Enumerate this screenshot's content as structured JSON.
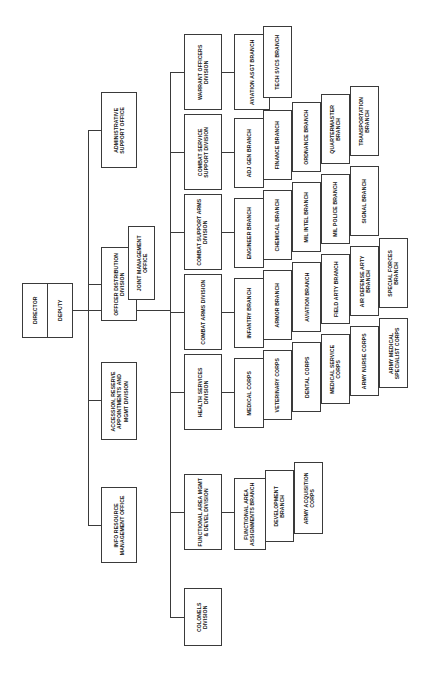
{
  "chart": {
    "orientation": "left-to-right hierarchy with vertically rotated text",
    "type": "org-chart"
  },
  "root": {
    "director": "DIRECTOR",
    "deputy": "DEPUTY"
  },
  "staff_offices": {
    "administrative_support_office": "ADMINISTRATIVE SUPPORT OFFICE",
    "officer_distribution_division": "OFFICER DISTRIBUTION DIVISION",
    "joint_management_office": "JOINT MANAGEMENT OFFICE",
    "accession_reserve": "ACCESSION, RESERVE APPOINTMENTS AND MGMT DIVISION",
    "info_resource_management_office": "INFO RESOURCE MANAGEMENT OFFICE"
  },
  "divisions": [
    {
      "id": "warrant-officers-division",
      "name": "WARRANT OFFICERS DIVISION",
      "branches": [
        "AVIATION ASGT BRANCH",
        "TECH SVCS BRANCH"
      ]
    },
    {
      "id": "combat-service-support-division",
      "name": "COMBAT SERVICE SUPPORT DIVISION",
      "branches": [
        "ADJ GEN BRANCH",
        "FINANCE BRANCH",
        "ORDNANCE BRANCH",
        "QUARTERMASTER BRANCH",
        "TRANSPORTATION BRANCH"
      ]
    },
    {
      "id": "combat-support-arms-division",
      "name": "COMBAT SUPPORT ARMS DIVISION",
      "branches": [
        "ENGINEER BRANCH",
        "CHEMICAL BRANCH",
        "MIL INTEL BRANCH",
        "MIL POLICE BRANCH",
        "SIGNAL BRANCH"
      ]
    },
    {
      "id": "combat-arms-division",
      "name": "COMBAT ARMS DIVISION",
      "branches": [
        "INFANTRY BRANCH",
        "ARMOR BRANCH",
        "AVIATION BRANCH",
        "FIELD ARTY BRANCH",
        "AIR DEFENSE ARTY BRANCH",
        "SPECIAL FORCES BRANCH"
      ]
    },
    {
      "id": "health-services-division",
      "name": "HEALTH SERVICES DIVISION",
      "branches": [
        "MEDICAL CORPS",
        "VETERINARY CORPS",
        "DENTAL CORPS",
        "MEDICAL SERVICE CORPS",
        "ARMY NURSE CORPS",
        "ARMY MEDICAL SPECIALIST CORPS"
      ]
    },
    {
      "id": "functional-area-mgmt-devel-division",
      "name": "FUNCTIONAL AREA MGMT & DEVEL DIVISION",
      "branches": [
        "FUNCTIONAL AREA ASSIGNMENTS BRANCH",
        "DEVELOPMENT BRANCH",
        "ARMY ACQUISITION CORPS"
      ]
    },
    {
      "id": "colonels-division",
      "name": "COLONELS DIVISION",
      "branches": []
    }
  ],
  "colors": {
    "box_border": "#3a3a3a",
    "line": "#3a3a3a",
    "text": "#111111",
    "background": "#ffffff"
  }
}
